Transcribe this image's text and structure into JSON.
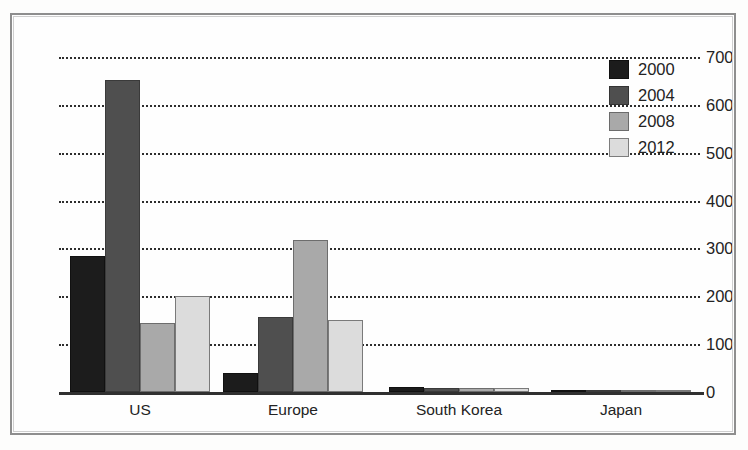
{
  "chart_data": {
    "type": "bar",
    "title": "",
    "xlabel": "",
    "ylabel": "",
    "categories": [
      "US",
      "Europe",
      "South Korea",
      "Japan"
    ],
    "series": [
      {
        "name": "2000",
        "color": "#1c1c1c",
        "values": [
          285,
          40,
          10,
          1
        ]
      },
      {
        "name": "2004",
        "color": "#4f4f4f",
        "values": [
          653,
          157,
          8,
          1
        ]
      },
      {
        "name": "2008",
        "color": "#a9a9a9",
        "values": [
          318,
          8,
          4,
          0
        ]
      },
      {
        "name": "2012",
        "color": "#dcdcdc",
        "values": [
          200,
          150,
          8,
          4
        ]
      }
    ],
    "ylim": [
      0,
      700
    ],
    "yticks": [
      0,
      100,
      200,
      300,
      400,
      500,
      600,
      700
    ],
    "ytick_labels": [
      "0",
      "100",
      "200",
      "300",
      "400",
      "500",
      "600",
      "700"
    ],
    "grid": true,
    "grid_style": "dotted-horizontal",
    "legend_position": "top-right",
    "legend_entries": [
      "2000",
      "2004",
      "2008",
      "2012"
    ]
  },
  "series_fix": {
    "note": "values per group in drawing order",
    "groups": [
      {
        "category": "US",
        "values": [
          285,
          653,
          145,
          200
        ]
      },
      {
        "category": "Europe",
        "values": [
          40,
          157,
          318,
          150
        ]
      },
      {
        "category": "South Korea",
        "values": [
          10,
          8,
          8,
          8
        ]
      },
      {
        "category": "Japan",
        "values": [
          1,
          1,
          4,
          4
        ]
      }
    ]
  }
}
